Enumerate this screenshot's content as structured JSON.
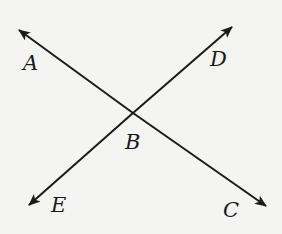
{
  "diagram": {
    "type": "intersecting-lines",
    "colors": {
      "background": "#f4f4f2",
      "line": "#1a1a1a"
    },
    "intersection": {
      "label": "B",
      "x": 133,
      "y": 113
    },
    "lines": [
      {
        "name": "line-AC",
        "from": "A",
        "to": "C"
      },
      {
        "name": "line-DE",
        "from": "D",
        "to": "E"
      }
    ],
    "points": {
      "A": {
        "label": "A",
        "tip_x": 19,
        "tip_y": 30
      },
      "C": {
        "label": "C",
        "tip_x": 266,
        "tip_y": 206
      },
      "D": {
        "label": "D",
        "tip_x": 232,
        "tip_y": 27
      },
      "E": {
        "label": "E",
        "tip_x": 29,
        "tip_y": 205
      }
    },
    "labels": {
      "A": "A",
      "B": "B",
      "C": "C",
      "D": "D",
      "E": "E"
    }
  }
}
